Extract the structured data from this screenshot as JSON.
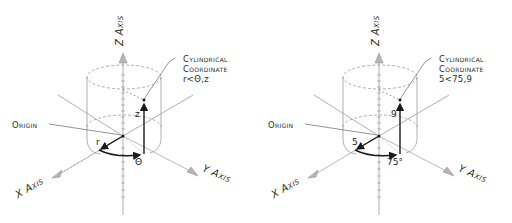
{
  "panels": [
    {
      "id": "generic",
      "axes": {
        "x": "X Axis",
        "y": "Y Axis",
        "z": "Z Axis"
      },
      "origin_label": "Origin",
      "callout": {
        "line1": "Cylindrical",
        "line2": "Coordinate",
        "line3": "r<Θ,z"
      },
      "radius_label": "r",
      "angle_label": "Θ",
      "height_label": "z"
    },
    {
      "id": "example",
      "axes": {
        "x": "X Axis",
        "y": "Y Axis",
        "z": "Z Axis"
      },
      "origin_label": "Origin",
      "callout": {
        "line1": "Cylindrical",
        "line2": "Coordinate",
        "line3": "5<75,9"
      },
      "radius_label": "5",
      "angle_label": "75°",
      "height_label": "9"
    }
  ],
  "colors": {
    "ink": "#1a1a1a",
    "axis": "#8a8a8a",
    "dashed": "#9a9a9a"
  }
}
